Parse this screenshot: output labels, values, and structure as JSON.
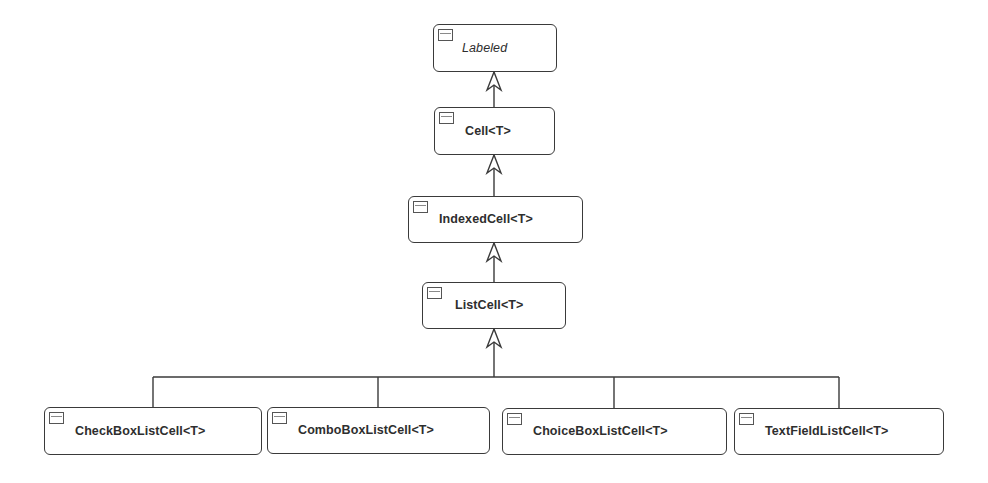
{
  "diagram": {
    "type": "uml-class-hierarchy",
    "colors": {
      "stroke": "#3a3a3a",
      "text": "#2e2e2e",
      "background": "#ffffff"
    },
    "classes": [
      {
        "id": "labeled",
        "name": "Labeled",
        "abstract": true,
        "x": 433,
        "y": 24,
        "w": 124,
        "h": 48,
        "tx": 28,
        "ty": 22
      },
      {
        "id": "cell",
        "name": "Cell<T>",
        "abstract": false,
        "x": 434,
        "y": 107,
        "w": 121,
        "h": 48,
        "tx": 30,
        "ty": 22
      },
      {
        "id": "indexedcell",
        "name": "IndexedCell<T>",
        "abstract": false,
        "x": 408,
        "y": 196,
        "w": 175,
        "h": 47,
        "tx": 30,
        "ty": 21
      },
      {
        "id": "listcell",
        "name": "ListCell<T>",
        "abstract": false,
        "x": 422,
        "y": 282,
        "w": 144,
        "h": 47,
        "tx": 32,
        "ty": 21
      },
      {
        "id": "checkboxlistcell",
        "name": "CheckBoxListCell<T>",
        "abstract": false,
        "x": 44,
        "y": 407,
        "w": 218,
        "h": 48,
        "tx": 30,
        "ty": 22
      },
      {
        "id": "comboboxlistcell",
        "name": "ComboBoxListCell<T>",
        "abstract": false,
        "x": 267,
        "y": 407,
        "w": 223,
        "h": 47,
        "tx": 30,
        "ty": 21
      },
      {
        "id": "choiceboxlistcell",
        "name": "ChoiceBoxListCell<T>",
        "abstract": false,
        "x": 502,
        "y": 408,
        "w": 225,
        "h": 47,
        "tx": 30,
        "ty": 21
      },
      {
        "id": "textfieldlistcell",
        "name": "TextFieldListCell<T>",
        "abstract": false,
        "x": 734,
        "y": 408,
        "w": 210,
        "h": 47,
        "tx": 30,
        "ty": 21
      }
    ],
    "generalizations": [
      {
        "child": "cell",
        "parent": "labeled"
      },
      {
        "child": "indexedcell",
        "parent": "cell"
      },
      {
        "child": "listcell",
        "parent": "indexedcell"
      },
      {
        "child": "checkboxlistcell",
        "parent": "listcell"
      },
      {
        "child": "comboboxlistcell",
        "parent": "listcell"
      },
      {
        "child": "choiceboxlistcell",
        "parent": "listcell"
      },
      {
        "child": "textfieldlistcell",
        "parent": "listcell"
      }
    ],
    "edges": {
      "stem_x": 494,
      "segments": [
        {
          "from_y": 107,
          "to_y": 72
        },
        {
          "from_y": 196,
          "to_y": 155
        },
        {
          "from_y": 282,
          "to_y": 243
        },
        {
          "from_y": 377,
          "to_y": 329
        }
      ],
      "bus": {
        "y": 377,
        "x1": 153,
        "x2": 839
      },
      "drops": [
        {
          "x": 153,
          "y1": 377,
          "y2": 407
        },
        {
          "x": 378,
          "y1": 377,
          "y2": 407
        },
        {
          "x": 614,
          "y1": 377,
          "y2": 408
        },
        {
          "x": 839,
          "y1": 377,
          "y2": 408
        }
      ],
      "arrow": {
        "half_width": 7,
        "length": 18,
        "inner_depth": 5
      }
    }
  }
}
